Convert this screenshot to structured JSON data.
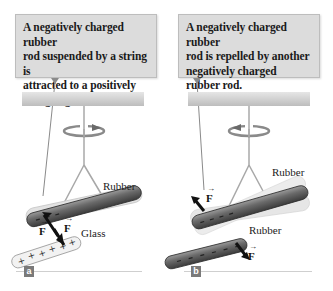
{
  "panels": [
    {
      "id": "a",
      "caption_lines": [
        "A negatively charged rubber",
        "rod suspended by a string is",
        "attracted to a positively",
        "charged glass rod."
      ],
      "labels": {
        "rod1": "Rubber",
        "rod2": "Glass"
      },
      "force_label": "F",
      "part_label": "a",
      "rod1_charge": "-",
      "rod2_charge": "+"
    },
    {
      "id": "b",
      "caption_lines": [
        "A negatively charged rubber",
        "rod is repelled by another",
        "negatively charged",
        "rubber rod."
      ],
      "labels": {
        "rod1": "Rubber",
        "rod2": "Rubber"
      },
      "force_label": "F",
      "part_label": "b",
      "rod1_charge": "-",
      "rod2_charge": "-"
    }
  ],
  "colors": {
    "callout_bg": "#dcdcdc",
    "ceiling": "#c8c8c8",
    "rubber_rod": "#5e5e5e",
    "glass_rod": "#efefef",
    "string": "#a8a8a8",
    "badge": "#7a7a7a"
  }
}
